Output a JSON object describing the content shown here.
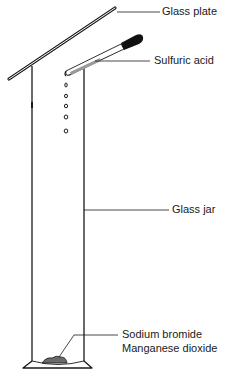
{
  "diagram": {
    "title": "",
    "labels": {
      "glass_plate": "Glass plate",
      "sulfuric_acid": "Sulfuric acid",
      "glass_jar": "Glass jar",
      "sodium_bromide": "Sodium bromide",
      "manganese_dioxide": "Manganese dioxide"
    },
    "components": [
      {
        "id": "glass-plate",
        "label": "Glass plate"
      },
      {
        "id": "dropper",
        "label": "Sulfuric acid"
      },
      {
        "id": "glass-jar",
        "label": "Glass jar"
      },
      {
        "id": "reagent-pile",
        "label": "Sodium bromide / Manganese dioxide"
      }
    ],
    "drops_count": 5,
    "colors": {
      "line": "#1a1a1a",
      "bulb": "#111111",
      "reagent": "#6b6b6b"
    }
  }
}
